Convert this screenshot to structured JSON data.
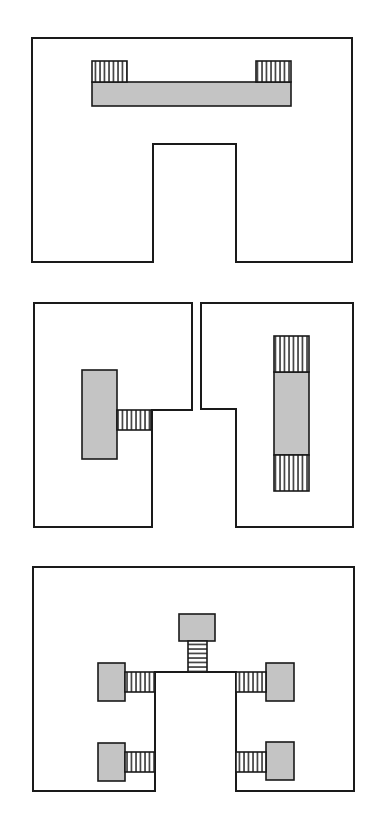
{
  "diagram": {
    "type": "layout-schematic",
    "panels": [
      {
        "id": "panel-1",
        "description": "U-shaped outline with a horizontal gray bar and two hatched end blocks",
        "outline": [
          [
            32,
            38
          ],
          [
            352,
            38
          ],
          [
            352,
            262
          ],
          [
            236,
            262
          ],
          [
            236,
            144
          ],
          [
            153,
            144
          ],
          [
            153,
            262
          ],
          [
            32,
            262
          ]
        ],
        "gray_blocks": [
          {
            "x": 92,
            "y": 82,
            "w": 199,
            "h": 24
          }
        ],
        "hatch_blocks": [
          {
            "x": 92,
            "y": 61,
            "w": 35,
            "h": 21,
            "dir": "vertical"
          },
          {
            "x": 256,
            "y": 61,
            "w": 35,
            "h": 21,
            "dir": "vertical"
          }
        ]
      },
      {
        "id": "panel-2",
        "description": "Two interlocking outlines; left with a gray block and hatched connector, right with a vertical gray block flanked by hatched blocks",
        "outlines": [
          [
            [
              34,
              303
            ],
            [
              192,
              303
            ],
            [
              192,
              410
            ],
            [
              152,
              410
            ],
            [
              152,
              527
            ],
            [
              34,
              527
            ]
          ],
          [
            [
              201,
              303
            ],
            [
              353,
              303
            ],
            [
              353,
              527
            ],
            [
              236,
              527
            ],
            [
              236,
              409
            ],
            [
              201,
              409
            ]
          ]
        ],
        "gray_blocks": [
          {
            "x": 82,
            "y": 370,
            "w": 35,
            "h": 89
          },
          {
            "x": 274,
            "y": 372,
            "w": 35,
            "h": 83
          }
        ],
        "hatch_blocks": [
          {
            "x": 117,
            "y": 410,
            "w": 34,
            "h": 20,
            "dir": "vertical"
          },
          {
            "x": 274,
            "y": 336,
            "w": 35,
            "h": 36,
            "dir": "vertical"
          },
          {
            "x": 274,
            "y": 455,
            "w": 35,
            "h": 36,
            "dir": "vertical"
          }
        ]
      },
      {
        "id": "panel-3",
        "description": "Outline with central notch; five gray pads connected by hatched connectors",
        "outline": [
          [
            33,
            567
          ],
          [
            354,
            567
          ],
          [
            354,
            791
          ],
          [
            236,
            791
          ],
          [
            236,
            672
          ],
          [
            155,
            672
          ],
          [
            155,
            791
          ],
          [
            33,
            791
          ]
        ],
        "gray_blocks": [
          {
            "x": 179,
            "y": 614,
            "w": 36,
            "h": 27
          },
          {
            "x": 98,
            "y": 663,
            "w": 27,
            "h": 38
          },
          {
            "x": 98,
            "y": 743,
            "w": 27,
            "h": 38
          },
          {
            "x": 266,
            "y": 663,
            "w": 28,
            "h": 38
          },
          {
            "x": 266,
            "y": 742,
            "w": 28,
            "h": 38
          }
        ],
        "hatch_blocks": [
          {
            "x": 188,
            "y": 641,
            "w": 19,
            "h": 31,
            "dir": "horizontal"
          },
          {
            "x": 125,
            "y": 672,
            "w": 30,
            "h": 20,
            "dir": "vertical"
          },
          {
            "x": 125,
            "y": 752,
            "w": 30,
            "h": 20,
            "dir": "vertical"
          },
          {
            "x": 236,
            "y": 672,
            "w": 30,
            "h": 20,
            "dir": "vertical"
          },
          {
            "x": 236,
            "y": 752,
            "w": 30,
            "h": 20,
            "dir": "vertical"
          }
        ]
      }
    ],
    "colors": {
      "stroke": "#1a1a1a",
      "gray_fill": "#c4c4c4",
      "background": "#ffffff"
    }
  }
}
